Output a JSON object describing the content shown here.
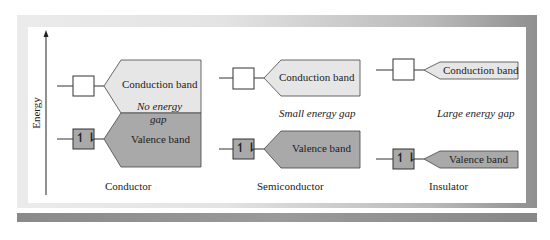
{
  "axis": {
    "label": "Energy"
  },
  "panels": [
    {
      "name": "Conductor",
      "conduction_label": "Conduction band",
      "gap_label_line1": "No energy",
      "gap_label_line2": "gap",
      "valence_label": "Valence band"
    },
    {
      "name": "Semiconductor",
      "conduction_label": "Conduction band",
      "gap_label": "Small energy gap",
      "valence_label": "Valence band"
    },
    {
      "name": "Insulator",
      "conduction_label": "Conduction band",
      "gap_label": "Large energy gap",
      "valence_label": "Valence band"
    }
  ],
  "colors": {
    "conduction_fill": "#e6e6e6",
    "valence_fill": "#a9a9a9",
    "stroke": "#333333"
  },
  "symbols": {
    "electron_pair": "↿⇂"
  }
}
